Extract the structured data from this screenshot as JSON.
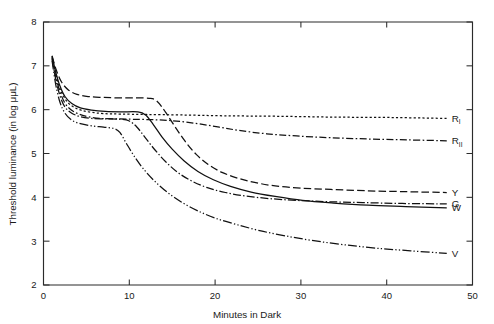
{
  "chart_data": {
    "type": "line",
    "title": "",
    "subtitle": "",
    "xlabel": "Minutes in Dark",
    "ylabel": "Threshold luminance (in log μμL)",
    "xlim": [
      0,
      50
    ],
    "ylim": [
      2,
      8
    ],
    "xticks": [
      0,
      10,
      20,
      30,
      40,
      50
    ],
    "yticks": [
      2,
      3,
      4,
      5,
      6,
      7,
      8
    ],
    "grid": false,
    "legend_position": "right-inline",
    "series": [
      {
        "name": "R_I",
        "label": "R",
        "sublabel": "I",
        "linestyle": "dotted",
        "dasharray": "2.2,2.2",
        "points": [
          [
            1.0,
            7.18
          ],
          [
            1.4,
            6.85
          ],
          [
            1.8,
            6.55
          ],
          [
            2.3,
            6.32
          ],
          [
            2.9,
            6.15
          ],
          [
            3.6,
            6.05
          ],
          [
            4.5,
            5.98
          ],
          [
            5.6,
            5.94
          ],
          [
            7.0,
            5.91
          ],
          [
            9.0,
            5.9
          ],
          [
            12.0,
            5.89
          ],
          [
            16.0,
            5.88
          ],
          [
            21.0,
            5.86
          ],
          [
            27.0,
            5.85
          ],
          [
            34.0,
            5.83
          ],
          [
            41.0,
            5.82
          ],
          [
            47.0,
            5.8
          ]
        ]
      },
      {
        "name": "R_II",
        "label": "R",
        "sublabel": "II",
        "linestyle": "dashdot",
        "dasharray": "7,2.4,1.6,2.4",
        "points": [
          [
            1.0,
            7.2
          ],
          [
            1.4,
            6.78
          ],
          [
            1.9,
            6.42
          ],
          [
            2.5,
            6.15
          ],
          [
            3.2,
            6.0
          ],
          [
            4.1,
            5.9
          ],
          [
            5.2,
            5.84
          ],
          [
            6.6,
            5.8
          ],
          [
            8.4,
            5.79
          ],
          [
            10.5,
            5.78
          ],
          [
            13.0,
            5.77
          ],
          [
            15.5,
            5.74
          ],
          [
            18.0,
            5.68
          ],
          [
            20.5,
            5.6
          ],
          [
            23.0,
            5.52
          ],
          [
            26.0,
            5.45
          ],
          [
            29.5,
            5.4
          ],
          [
            33.5,
            5.36
          ],
          [
            38.0,
            5.33
          ],
          [
            42.5,
            5.31
          ],
          [
            47.0,
            5.29
          ]
        ]
      },
      {
        "name": "Y",
        "label": "Y",
        "sublabel": "",
        "linestyle": "dashed",
        "dasharray": "7.5,3.2",
        "points": [
          [
            1.0,
            7.22
          ],
          [
            1.5,
            6.9
          ],
          [
            2.1,
            6.63
          ],
          [
            2.9,
            6.45
          ],
          [
            3.9,
            6.35
          ],
          [
            5.2,
            6.3
          ],
          [
            6.8,
            6.28
          ],
          [
            8.6,
            6.27
          ],
          [
            10.6,
            6.27
          ],
          [
            12.3,
            6.26
          ],
          [
            13.2,
            6.2
          ],
          [
            14.2,
            5.95
          ],
          [
            15.3,
            5.62
          ],
          [
            16.5,
            5.28
          ],
          [
            17.8,
            4.98
          ],
          [
            19.2,
            4.75
          ],
          [
            20.8,
            4.57
          ],
          [
            22.6,
            4.44
          ],
          [
            24.6,
            4.34
          ],
          [
            27.0,
            4.26
          ],
          [
            30.0,
            4.21
          ],
          [
            33.5,
            4.18
          ],
          [
            37.5,
            4.15
          ],
          [
            42.0,
            4.13
          ],
          [
            47.0,
            4.11
          ]
        ]
      },
      {
        "name": "G",
        "label": "G",
        "sublabel": "",
        "linestyle": "dashdot",
        "dasharray": "8,2.2,1.4,2.2",
        "points": [
          [
            1.0,
            7.15
          ],
          [
            1.4,
            6.72
          ],
          [
            1.9,
            6.33
          ],
          [
            2.5,
            6.06
          ],
          [
            3.3,
            5.92
          ],
          [
            4.3,
            5.84
          ],
          [
            5.6,
            5.8
          ],
          [
            7.2,
            5.79
          ],
          [
            9.0,
            5.78
          ],
          [
            10.0,
            5.74
          ],
          [
            10.9,
            5.6
          ],
          [
            11.9,
            5.35
          ],
          [
            13.0,
            5.08
          ],
          [
            14.3,
            4.8
          ],
          [
            15.7,
            4.56
          ],
          [
            17.3,
            4.37
          ],
          [
            19.1,
            4.22
          ],
          [
            21.2,
            4.11
          ],
          [
            23.6,
            4.03
          ],
          [
            26.4,
            3.97
          ],
          [
            29.6,
            3.93
          ],
          [
            33.2,
            3.9
          ],
          [
            37.2,
            3.88
          ],
          [
            41.8,
            3.86
          ],
          [
            47.0,
            3.85
          ]
        ]
      },
      {
        "name": "W",
        "label": "W",
        "sublabel": "",
        "linestyle": "solid",
        "dasharray": "",
        "points": [
          [
            1.0,
            7.23
          ],
          [
            1.4,
            6.88
          ],
          [
            1.9,
            6.55
          ],
          [
            2.5,
            6.3
          ],
          [
            3.3,
            6.14
          ],
          [
            4.3,
            6.04
          ],
          [
            5.6,
            5.99
          ],
          [
            7.2,
            5.96
          ],
          [
            9.0,
            5.95
          ],
          [
            11.0,
            5.95
          ],
          [
            11.9,
            5.88
          ],
          [
            12.8,
            5.66
          ],
          [
            13.8,
            5.38
          ],
          [
            15.0,
            5.1
          ],
          [
            16.4,
            4.83
          ],
          [
            18.0,
            4.59
          ],
          [
            19.8,
            4.4
          ],
          [
            21.8,
            4.25
          ],
          [
            24.2,
            4.12
          ],
          [
            27.0,
            4.02
          ],
          [
            30.2,
            3.93
          ],
          [
            33.8,
            3.87
          ],
          [
            37.8,
            3.82
          ],
          [
            42.2,
            3.79
          ],
          [
            47.0,
            3.76
          ]
        ]
      },
      {
        "name": "V",
        "label": "V",
        "sublabel": "",
        "linestyle": "dashdotdot",
        "dasharray": "9,2.2,1.3,2.2,1.3,2.2",
        "points": [
          [
            1.0,
            7.12
          ],
          [
            1.4,
            6.6
          ],
          [
            1.9,
            6.18
          ],
          [
            2.5,
            5.92
          ],
          [
            3.3,
            5.76
          ],
          [
            4.3,
            5.68
          ],
          [
            5.6,
            5.63
          ],
          [
            7.0,
            5.6
          ],
          [
            8.2,
            5.57
          ],
          [
            8.9,
            5.48
          ],
          [
            9.6,
            5.25
          ],
          [
            10.5,
            4.96
          ],
          [
            11.6,
            4.66
          ],
          [
            12.9,
            4.38
          ],
          [
            14.4,
            4.12
          ],
          [
            16.1,
            3.89
          ],
          [
            18.0,
            3.69
          ],
          [
            20.1,
            3.52
          ],
          [
            22.5,
            3.38
          ],
          [
            25.2,
            3.24
          ],
          [
            28.2,
            3.12
          ],
          [
            31.5,
            3.01
          ],
          [
            35.0,
            2.92
          ],
          [
            38.8,
            2.84
          ],
          [
            42.8,
            2.78
          ],
          [
            47.0,
            2.72
          ]
        ]
      }
    ]
  }
}
